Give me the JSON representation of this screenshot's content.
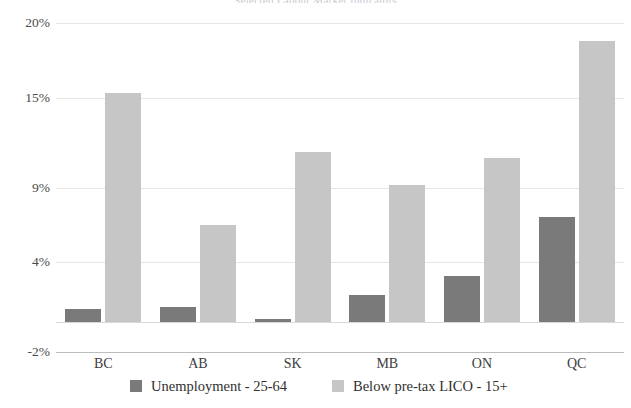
{
  "chart_data": {
    "type": "bar",
    "title": "Selected Labour Market Indicators",
    "xlabel": "",
    "ylabel": "",
    "categories": [
      "BC",
      "AB",
      "SK",
      "MB",
      "ON",
      "QC"
    ],
    "series": [
      {
        "name": "Unemployment - 25-64",
        "color": "#7a7a7a",
        "values": [
          0.9,
          1.0,
          0.2,
          1.8,
          3.1,
          7.0
        ]
      },
      {
        "name": "Below pre-tax LICO - 15+",
        "color": "#c6c6c6",
        "values": [
          15.3,
          6.5,
          11.4,
          9.2,
          11.0,
          18.8
        ]
      }
    ],
    "ylim": [
      -2,
      20
    ],
    "ytick_values": [
      20,
      15,
      9,
      4,
      -2
    ],
    "ytick_labels": [
      "20%",
      "15%",
      "9%",
      "4%",
      "-2%"
    ],
    "grid": true,
    "legend_position": "bottom"
  }
}
